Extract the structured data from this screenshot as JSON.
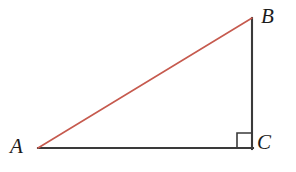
{
  "figure": {
    "type": "right-triangle-diagram",
    "canvas": {
      "width": 296,
      "height": 172,
      "background": "#ffffff"
    },
    "vertices": [
      {
        "id": "A",
        "label": "A",
        "x": 38,
        "y": 148,
        "label_x": 10,
        "label_y": 136
      },
      {
        "id": "B",
        "label": "B",
        "x": 252,
        "y": 18,
        "label_x": 261,
        "label_y": 6
      },
      {
        "id": "C",
        "label": "C",
        "x": 252,
        "y": 148,
        "label_x": 257,
        "label_y": 132
      }
    ],
    "segments": [
      {
        "id": "AB",
        "name": "hypotenuse",
        "from": "A",
        "to": "B",
        "color": "#c65a4e",
        "width": 1.6
      },
      {
        "id": "AC",
        "name": "base-leg",
        "from": "A",
        "to": "C",
        "color": "#3a3a3a",
        "width": 2.1
      },
      {
        "id": "BC",
        "name": "vertical-leg",
        "from": "B",
        "to": "C",
        "color": "#3a3a3a",
        "width": 2.1
      }
    ],
    "right_angle_marker": {
      "at_vertex": "C",
      "x": 237,
      "y": 133,
      "size": 15,
      "color": "#3a3a3a",
      "width": 1.6
    }
  }
}
